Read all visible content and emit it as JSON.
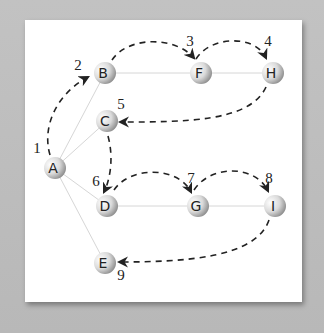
{
  "diagram": {
    "title": "",
    "type": "breadth-first traversal tree",
    "colors": {
      "background": "#bdbdbd",
      "panel": "#ffffff",
      "edge": "#d6d6d6",
      "traversal_arrow": "#222222",
      "node_light": "#ffffff",
      "node_dark": "#8a8a8a"
    },
    "nodes": [
      {
        "id": "A",
        "label": "A",
        "x": 55,
        "y": 168
      },
      {
        "id": "B",
        "label": "B",
        "x": 105,
        "y": 73
      },
      {
        "id": "C",
        "label": "C",
        "x": 107,
        "y": 121
      },
      {
        "id": "D",
        "label": "D",
        "x": 107,
        "y": 206
      },
      {
        "id": "E",
        "label": "E",
        "x": 105,
        "y": 263
      },
      {
        "id": "F",
        "label": "F",
        "x": 201,
        "y": 73
      },
      {
        "id": "G",
        "label": "G",
        "x": 198,
        "y": 206
      },
      {
        "id": "H",
        "label": "H",
        "x": 273,
        "y": 73
      },
      {
        "id": "I",
        "label": "I",
        "x": 275,
        "y": 206
      }
    ],
    "edges": [
      [
        "A",
        "B"
      ],
      [
        "A",
        "C"
      ],
      [
        "A",
        "D"
      ],
      [
        "A",
        "E"
      ],
      [
        "B",
        "F"
      ],
      [
        "F",
        "H"
      ],
      [
        "D",
        "G"
      ],
      [
        "G",
        "I"
      ]
    ],
    "traversal_order": [
      {
        "step": "1",
        "node": "A",
        "x": 37,
        "y": 148
      },
      {
        "step": "2",
        "node": "B",
        "x": 78,
        "y": 65
      },
      {
        "step": "3",
        "node": "F",
        "x": 190,
        "y": 41
      },
      {
        "step": "4",
        "node": "H",
        "x": 268,
        "y": 41
      },
      {
        "step": "5",
        "node": "C",
        "x": 121,
        "y": 104
      },
      {
        "step": "6",
        "node": "D",
        "x": 96,
        "y": 181
      },
      {
        "step": "7",
        "node": "G",
        "x": 191,
        "y": 178
      },
      {
        "step": "8",
        "node": "I",
        "x": 269,
        "y": 178
      },
      {
        "step": "9",
        "node": "E",
        "x": 121,
        "y": 275
      }
    ],
    "traversal_arrows": [
      {
        "from": "A",
        "to": "B",
        "path": "M 50 155 C 42 128, 55 95, 88 77"
      },
      {
        "from": "B",
        "to": "F",
        "path": "M 112 60 C 128 36, 175 36, 194 58"
      },
      {
        "from": "F",
        "to": "H",
        "path": "M 196 59 C 210 36, 255 34, 266 58"
      },
      {
        "from": "H",
        "to": "C",
        "path": "M 266 87 C 250 122, 185 122, 120 122"
      },
      {
        "from": "C",
        "to": "D",
        "path": "M 108 136 C 114 158, 110 180, 104 192"
      },
      {
        "from": "D",
        "to": "G",
        "path": "M 114 190 C 130 166, 178 166, 191 192"
      },
      {
        "from": "G",
        "to": "I",
        "path": "M 194 190 C 210 165, 255 164, 268 191"
      },
      {
        "from": "I",
        "to": "E",
        "path": "M 269 220 C 256 258, 185 262, 119 262"
      }
    ]
  }
}
